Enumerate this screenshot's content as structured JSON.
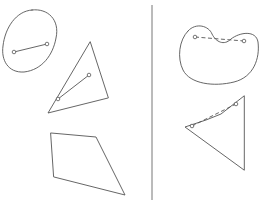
{
  "figure": {
    "colors": {
      "stroke": "#555555",
      "background": "#ffffff",
      "divider": "#777777"
    },
    "divider": {
      "x": 152,
      "y1": 5,
      "y2": 200
    },
    "left_panel": {
      "label": "convex",
      "shapes": [
        {
          "name": "convex-blob",
          "path": "M 32 10 C 48 8, 60 20, 56 38 C 53 55, 42 70, 24 72 C 8 73, 1 60, 3 46 C 5 28, 16 11, 32 10 Z",
          "segment": {
            "p1": [
              14,
              52
            ],
            "p2": [
              47,
              44
            ],
            "style": "solid"
          }
        },
        {
          "name": "convex-triangle",
          "points": "90,42 48,113 108,98",
          "segment": {
            "p1": [
              58,
              99
            ],
            "p2": [
              89,
              75
            ],
            "style": "solid"
          }
        },
        {
          "name": "convex-quadrilateral",
          "points": "51,133 96,137 125,195 54,177"
        }
      ]
    },
    "right_panel": {
      "label": "non-convex",
      "shapes": [
        {
          "name": "nonconvex-kidney",
          "path": "M 188 31 C 196 22, 209 26, 212 34 C 216 42, 224 46, 231 39 C 240 32, 256 30, 258 42 C 260 58, 254 77, 234 82 C 214 87, 190 84, 183 70 C 177 58, 179 40, 188 31 Z",
          "segment": {
            "p1": [
              195,
              37
            ],
            "p2": [
              244,
              41
            ],
            "style": "dashed"
          }
        },
        {
          "name": "nonconvex-dart",
          "points": "244,96 221,114 206,120 185,127 244,170",
          "segment": {
            "p1": [
              192,
              126
            ],
            "p2": [
              236,
              104
            ],
            "style": "dashed"
          }
        }
      ]
    }
  }
}
